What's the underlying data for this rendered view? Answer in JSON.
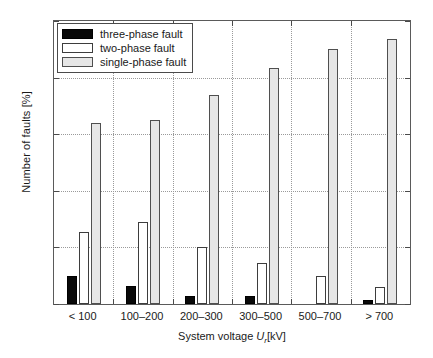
{
  "chart_data": {
    "type": "bar",
    "title": "",
    "xlabel": "System voltage U_r [kV]",
    "xlabel_parts": {
      "pre": "System voltage ",
      "symbol": "U",
      "subscript": "r",
      "post": "[kV]"
    },
    "ylabel": "Number of faults [%]",
    "categories": [
      "< 100",
      "100–200",
      "200–300",
      "300–500",
      "500–700",
      "> 700"
    ],
    "series": [
      {
        "name": "three-phase fault",
        "color": "#090909",
        "values": [
          10,
          6.5,
          3,
          3,
          0,
          1.5
        ]
      },
      {
        "name": "two-phase fault",
        "color": "#ffffff",
        "values": [
          25.5,
          29,
          20,
          14.5,
          10,
          6
        ]
      },
      {
        "name": "single-phase fault",
        "color": "#e6e6e6",
        "values": [
          64,
          65,
          74,
          83.5,
          90,
          93.5
        ]
      }
    ],
    "ylim": [
      0,
      100
    ],
    "yticks": [
      0,
      20,
      40,
      60,
      80,
      100
    ],
    "ytick_labels": [
      "0",
      "20",
      "40",
      "60",
      "80",
      "100"
    ],
    "grid": true,
    "grid_style": "dotted",
    "grid_color": "#9a9a9a",
    "legend_position": "upper-left",
    "legend_entries": [
      "three-phase fault",
      "two-phase fault",
      "single-phase fault"
    ],
    "axis_color": "#5a5a5a",
    "background": "#ffffff"
  }
}
